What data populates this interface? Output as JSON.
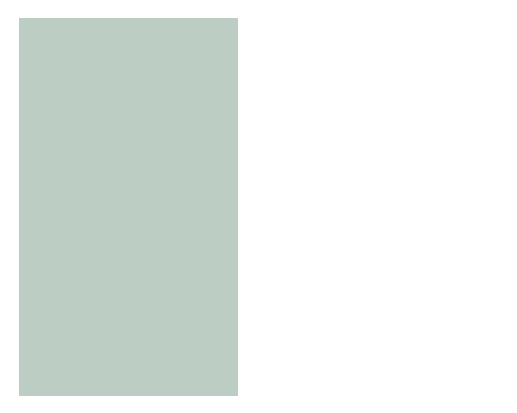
{
  "diagram": {
    "title_hint": "Seismic wave travel-time curve and ray paths",
    "colors": {
      "background": "#bccdc3",
      "frame": "#4a4a4a",
      "curve": "#d63a24",
      "arrow_red": "#d0301c",
      "arrow_blue": "#3a6fb0",
      "panel_yellow": "#f3efb8",
      "panel_blue": "#c3cfd2",
      "panel_orange": "#edcfa6",
      "callout_bg": "#e3ede6"
    },
    "axes": {
      "time_label": "Time",
      "angular_label": "Angular distance",
      "depth_label": "Depth",
      "velocity_label_lines": [
        "Seismic",
        "wave",
        "velocity"
      ]
    },
    "curve_label_lines": [
      "Earthquake",
      "wave arrival"
    ],
    "callouts": {
      "arrival": [
        "Arrival-time curve",
        "reveals faster average",
        "velocity for waves that",
        "travel the farthest",
        "angular distance."
      ],
      "farthest": [
        "Waves that travel",
        "farthest also",
        "travel deepest."
      ],
      "velocity": [
        "Wave velocity",
        "is faster in",
        "deeper layers."
      ],
      "rays": [
        "Rays refract to",
        "follow curved paths",
        "between focus",
        "and surface."
      ]
    }
  }
}
